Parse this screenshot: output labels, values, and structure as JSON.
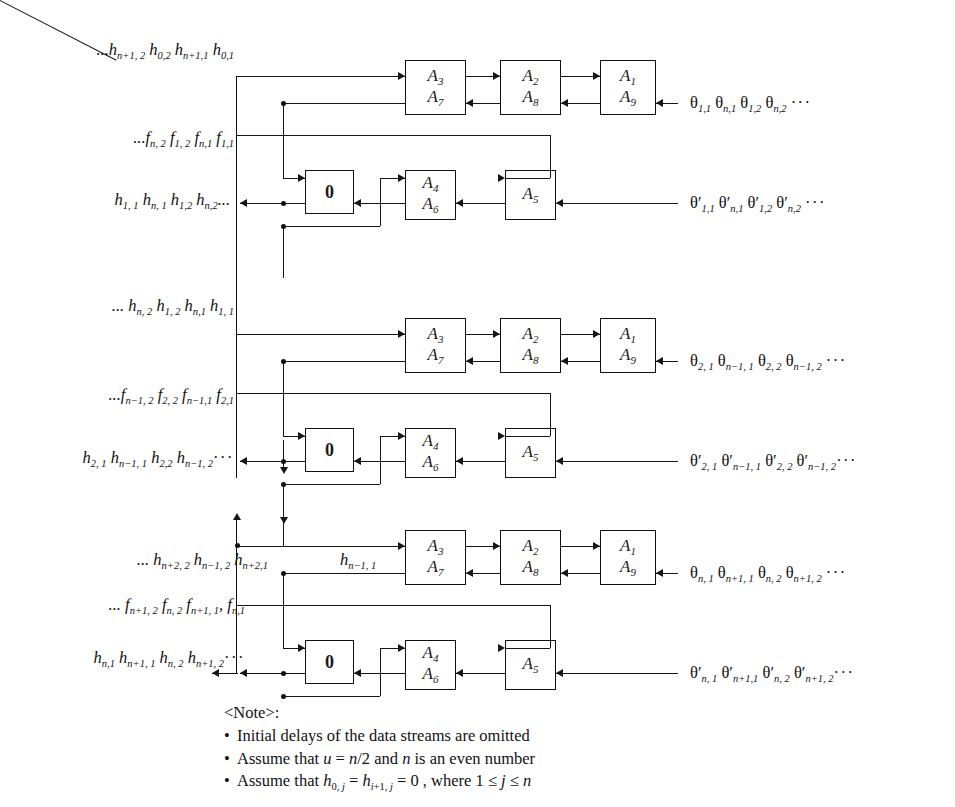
{
  "figure": {
    "type": "signal-flow-diagram"
  },
  "blocks": [
    {
      "id": "block-1",
      "top_row_cells": [
        {
          "name": "cell-a3-a7",
          "upper": "A",
          "upper_sub": "3",
          "lower": "A",
          "lower_sub": "7"
        },
        {
          "name": "cell-a2-a8",
          "upper": "A",
          "upper_sub": "2",
          "lower": "A",
          "lower_sub": "8"
        },
        {
          "name": "cell-a1-a9",
          "upper": "A",
          "upper_sub": "1",
          "lower": "A",
          "lower_sub": "9"
        }
      ],
      "bottom_row_cells": [
        {
          "name": "cell-zero",
          "label": "0"
        },
        {
          "name": "cell-a4-a6",
          "upper": "A",
          "upper_sub": "4",
          "lower": "A",
          "lower_sub": "6"
        },
        {
          "name": "cell-a5",
          "label": "A",
          "label_sub": "5"
        }
      ],
      "left_labels": [
        {
          "name": "stream-h-top",
          "html": "...<i>h</i><sub>n+1, 2</sub> <i>h</i><sub>0,2</sub> <i>h</i><sub>n+1,1</sub> <i>h</i><sub>0,1</sub>"
        },
        {
          "name": "stream-f",
          "html": "...<i>f</i><sub>n, 2</sub> <i>f</i><sub>1, 2</sub> <i>f</i><sub>n,1</sub> <i>f</i><sub>1,1</sub>"
        },
        {
          "name": "stream-h-out",
          "html": "<i>h</i><sub>1, 1</sub> <i>h</i><sub>n, 1</sub> <i>h</i><sub>1,2</sub> <i>h</i><sub>n,2</sub>..."
        }
      ],
      "right_labels": [
        {
          "name": "stream-theta-top",
          "html": "<span class='theta'>θ</span><sub>1,1</sub> <span class='theta'>θ</span><sub>n,1</sub> <span class='theta'>θ</span><sub>1,2</sub> <span class='theta'>θ</span><sub>n,2</sub> <span class='dots'>···</span>"
        },
        {
          "name": "stream-theta-prime",
          "html": "<span class='theta'>θ</span>′<sub>1,1</sub> <span class='theta'>θ</span>′<sub>n,1</sub> <span class='theta'>θ</span>′<sub>1,2</sub> <span class='theta'>θ</span>′<sub>n,2</sub> <span class='dots'>···</span>"
        }
      ]
    },
    {
      "id": "block-2",
      "top_row_cells": [
        {
          "name": "cell-a3-a7",
          "upper": "A",
          "upper_sub": "3",
          "lower": "A",
          "lower_sub": "7"
        },
        {
          "name": "cell-a2-a8",
          "upper": "A",
          "upper_sub": "2",
          "lower": "A",
          "lower_sub": "8"
        },
        {
          "name": "cell-a1-a9",
          "upper": "A",
          "upper_sub": "1",
          "lower": "A",
          "lower_sub": "9"
        }
      ],
      "bottom_row_cells": [
        {
          "name": "cell-zero",
          "label": "0"
        },
        {
          "name": "cell-a4-a6",
          "upper": "A",
          "upper_sub": "4",
          "lower": "A",
          "lower_sub": "6"
        },
        {
          "name": "cell-a5",
          "label": "A",
          "label_sub": "5"
        }
      ],
      "left_labels": [
        {
          "name": "stream-h-top",
          "html": "... <i>h</i><sub>n, 2</sub> <i>h</i><sub>1, 2</sub> <i>h</i><sub>n,1</sub> <i>h</i><sub>1, 1</sub>"
        },
        {
          "name": "stream-f",
          "html": "...<i>f</i><sub>n−1, 2</sub> <i>f</i><sub>2, 2</sub> <i>f</i><sub>n−1,1</sub> <i>f</i><sub>2,1</sub>"
        },
        {
          "name": "stream-h-out",
          "html": "<i>h</i><sub>2, 1</sub> <i>h</i><sub>n−1, 1</sub> <i>h</i><sub>2,2</sub> <i>h</i><sub>n−1, 2</sub><span class='dots'>···</span>"
        }
      ],
      "right_labels": [
        {
          "name": "stream-theta-top",
          "html": "<span class='theta'>θ</span><sub>2, 1</sub> <span class='theta'>θ</span><sub>n−1, 1</sub> <span class='theta'>θ</span><sub>2, 2</sub> <span class='theta'>θ</span><sub>n−1, 2</sub> <span class='dots'>···</span>"
        },
        {
          "name": "stream-theta-prime",
          "html": "<span class='theta'>θ</span>′<sub>2, 1</sub> <span class='theta'>θ</span>′<sub>n−1, 1</sub> <span class='theta'>θ</span>′<sub>2, 2</sub> <span class='theta'>θ</span>′<sub>n−1, 2</sub><span class='dots'>···</span>"
        }
      ]
    },
    {
      "id": "block-3",
      "top_row_cells": [
        {
          "name": "cell-a3-a7",
          "upper": "A",
          "upper_sub": "3",
          "lower": "A",
          "lower_sub": "7"
        },
        {
          "name": "cell-a2-a8",
          "upper": "A",
          "upper_sub": "2",
          "lower": "A",
          "lower_sub": "8"
        },
        {
          "name": "cell-a1-a9",
          "upper": "A",
          "upper_sub": "1",
          "lower": "A",
          "lower_sub": "9"
        }
      ],
      "bottom_row_cells": [
        {
          "name": "cell-zero",
          "label": "0"
        },
        {
          "name": "cell-a4-a6",
          "upper": "A",
          "upper_sub": "4",
          "lower": "A",
          "lower_sub": "6"
        },
        {
          "name": "cell-a5",
          "label": "A",
          "label_sub": "5"
        }
      ],
      "left_labels": [
        {
          "name": "stream-h-top",
          "html": "... <i>h</i><sub>n+2, 2</sub> <i>h</i><sub>n−1, 2</sub> <i>h</i><sub>n+2,1</sub>"
        },
        {
          "name": "stream-h-top-2",
          "html": "<i>h</i><sub>n−1, 1</sub>"
        },
        {
          "name": "stream-f",
          "html": "... <i>f</i><sub>n+1, 2</sub> <i>f</i><sub>n, 2</sub> <i>f</i><sub>n+1, 1</sub>, <i>f</i><sub>n,1</sub>"
        },
        {
          "name": "stream-h-out",
          "html": "<i>h</i><sub>n,1</sub> <i>h</i><sub>n+1, 1</sub> <i>h</i><sub>n, 2</sub> <i>h</i><sub>n+1, 2</sub><span class='dots'>···</span>"
        }
      ],
      "right_labels": [
        {
          "name": "stream-theta-top",
          "html": "<span class='theta'>θ</span><sub>n, 1</sub> <span class='theta'>θ</span><sub>n+1, 1</sub> <span class='theta'>θ</span><sub>n, 2</sub> <span class='theta'>θ</span><sub>n+1, 2</sub> <span class='dots'>···</span>"
        },
        {
          "name": "stream-theta-prime",
          "html": "<span class='theta'>θ</span>′<sub>n, 1</sub> <span class='theta'>θ</span>′<sub>n+1,1</sub> <span class='theta'>θ</span>′<sub>n, 2</sub> <span class='theta'>θ</span>′<sub>n+1, 2</sub><span class='dots'>···</span>"
        }
      ]
    }
  ],
  "note": {
    "title": "<Note>:",
    "items": [
      {
        "name": "note-item-1",
        "html": "Initial delays of the data streams are omitted"
      },
      {
        "name": "note-item-2",
        "html": "Assume that <i>u</i> = <i>n</i>/2 and <i>n</i> is an even number"
      },
      {
        "name": "note-item-3",
        "html": "Assume that <i>h</i><sub>0, <i>j</i></sub> = <i>h</i><sub><i>i</i>+1, <i>j</i></sub> = 0 , where 1 ≤ <i>j</i> ≤ <i>n</i>"
      }
    ]
  },
  "colors": {
    "line": "#151515",
    "box_border": "#111111",
    "background": "#ffffff",
    "text": "#1a1a1a"
  }
}
